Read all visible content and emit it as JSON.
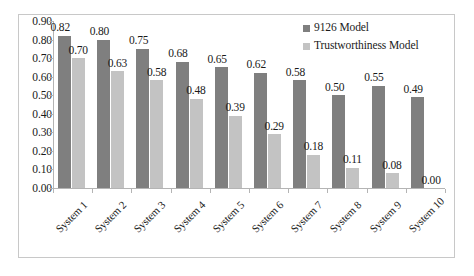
{
  "chart_data": {
    "type": "bar",
    "title": "",
    "xlabel": "",
    "ylabel": "",
    "ylim": [
      0.0,
      0.9
    ],
    "grid": false,
    "legend_position": "top-right",
    "categories": [
      "System 1",
      "System 2",
      "System 3",
      "System 4",
      "System 5",
      "System 6",
      "System 7",
      "System 8",
      "System 9",
      "System 10"
    ],
    "ytick_labels": [
      "0.90",
      "0.80",
      "0.70",
      "0.60",
      "0.50",
      "0.40",
      "0.30",
      "0.20",
      "0.10",
      "0.00"
    ],
    "ytick_values": [
      0.9,
      0.8,
      0.7,
      0.6,
      0.5,
      0.4,
      0.3,
      0.2,
      0.1,
      0.0
    ],
    "series": [
      {
        "name": "9126 Model",
        "color": "#7f7f7f",
        "values": [
          0.82,
          0.8,
          0.75,
          0.68,
          0.65,
          0.62,
          0.58,
          0.5,
          0.55,
          0.49
        ],
        "labels": [
          "0.82",
          "0.80",
          "0.75",
          "0.68",
          "0.65",
          "0.62",
          "0.58",
          "0.50",
          "0.55",
          "0.49"
        ]
      },
      {
        "name": "Trustworthiness  Model",
        "color": "#c3c3c3",
        "values": [
          0.7,
          0.63,
          0.58,
          0.48,
          0.39,
          0.29,
          0.18,
          0.11,
          0.08,
          0.0
        ],
        "labels": [
          "0.70",
          "0.63",
          "0.58",
          "0.48",
          "0.39",
          "0.29",
          "0.18",
          "0.11",
          "0.08",
          "0.00"
        ]
      }
    ]
  },
  "legend": {
    "entries": [
      {
        "label": "9126 Model",
        "color": "#7f7f7f"
      },
      {
        "label": "Trustworthiness  Model",
        "color": "#c3c3c3"
      }
    ]
  }
}
